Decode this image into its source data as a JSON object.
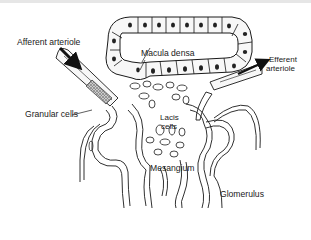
{
  "diagram": {
    "type": "anatomical-illustration",
    "labels": {
      "afferent_arteriole": "Afferent arteriole",
      "macula_densa": "Macula densa",
      "efferent_arteriole_line1": "Efferent",
      "efferent_arteriole_line2": "arteriole",
      "granular_cells": "Granular cells",
      "lacis_cells_line1": "Lacis",
      "lacis_cells_line2": "cells",
      "mesangium": "Mesangium",
      "glomerulus": "Glomerulus"
    },
    "arrows": [
      {
        "name": "afferent-flow-arrow",
        "direction": "down-right"
      },
      {
        "name": "efferent-flow-arrow",
        "direction": "up-right"
      }
    ],
    "colors": {
      "line": "#1a1a1a",
      "background": "#ffffff",
      "cell_fill": "#f4f4f4"
    }
  }
}
